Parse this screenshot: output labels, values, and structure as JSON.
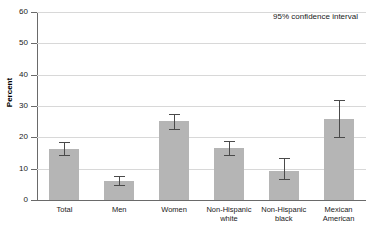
{
  "chart_data": {
    "type": "bar",
    "title": "",
    "subtitle": "",
    "xlabel": "",
    "ylabel": "Percent",
    "ylim": [
      0,
      60
    ],
    "yticks": [
      0,
      10,
      20,
      30,
      40,
      50,
      60
    ],
    "ytick_labels": [
      "0",
      "10",
      "20",
      "30",
      "40",
      "50",
      "60"
    ],
    "grid": true,
    "legend": null,
    "annotations": [
      "95% confidence interval"
    ],
    "error_bar_type": "95% confidence interval",
    "categories": [
      "Total",
      "Men",
      "Women",
      "Non-Hispanic white",
      "Non-Hispanic black",
      "Mexican American"
    ],
    "category_lines": [
      [
        "Total"
      ],
      [
        "Men"
      ],
      [
        "Women"
      ],
      [
        "Non-Hispanic",
        "white"
      ],
      [
        "Non-Hispanic",
        "black"
      ],
      [
        "Mexican",
        "American"
      ]
    ],
    "values": [
      16.3,
      6.0,
      25.3,
      16.5,
      9.2,
      26.0
    ],
    "ci_low": [
      14.5,
      4.8,
      22.8,
      14.3,
      6.8,
      20.0
    ],
    "ci_high": [
      18.5,
      7.8,
      27.6,
      18.8,
      13.4,
      32.0
    ],
    "bar_color": "#b5b5b5",
    "error_color": "#4a4a4a",
    "grid_color": "#d8d8d8",
    "axis_color": "#6a6a6a",
    "background": "#ffffff"
  },
  "annotation": {
    "confidence_interval": "95% confidence interval"
  },
  "axis": {
    "y_title": "Percent"
  }
}
